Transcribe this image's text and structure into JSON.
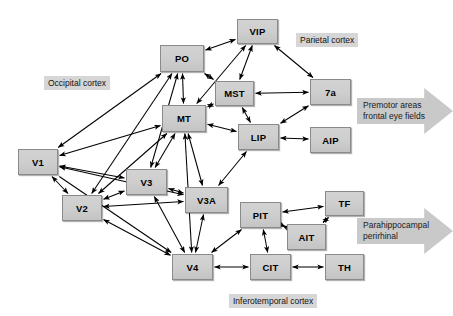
{
  "figure": {
    "background": "#ffffff",
    "node_fill": "#cfcfcf",
    "node_border": "#8a8a8a",
    "label_fill": "#d6d6d6",
    "arrow_fill": "#c9c9c9",
    "edge_color": "#000000"
  },
  "nodes": [
    {
      "id": "V1",
      "label": "V1",
      "x": 18,
      "y": 149,
      "w": 40,
      "h": 26
    },
    {
      "id": "V2",
      "label": "V2",
      "x": 62,
      "y": 195,
      "w": 40,
      "h": 26
    },
    {
      "id": "V3",
      "label": "V3",
      "x": 126,
      "y": 169,
      "w": 41,
      "h": 26
    },
    {
      "id": "V3A",
      "label": "V3A",
      "x": 185,
      "y": 187,
      "w": 43,
      "h": 26
    },
    {
      "id": "V4",
      "label": "V4",
      "x": 172,
      "y": 254,
      "w": 41,
      "h": 26
    },
    {
      "id": "PO",
      "label": "PO",
      "x": 160,
      "y": 45,
      "w": 44,
      "h": 27
    },
    {
      "id": "MT",
      "label": "MT",
      "x": 162,
      "y": 105,
      "w": 44,
      "h": 27
    },
    {
      "id": "VIP",
      "label": "VIP",
      "x": 237,
      "y": 19,
      "w": 41,
      "h": 25
    },
    {
      "id": "MST",
      "label": "MST",
      "x": 215,
      "y": 81,
      "w": 39,
      "h": 25
    },
    {
      "id": "LIP",
      "label": "LIP",
      "x": 238,
      "y": 124,
      "w": 41,
      "h": 26
    },
    {
      "id": "7a",
      "label": "7a",
      "x": 310,
      "y": 79,
      "w": 41,
      "h": 26
    },
    {
      "id": "AIP",
      "label": "AIP",
      "x": 310,
      "y": 127,
      "w": 41,
      "h": 26
    },
    {
      "id": "PIT",
      "label": "PIT",
      "x": 240,
      "y": 202,
      "w": 41,
      "h": 26
    },
    {
      "id": "AIT",
      "label": "AIT",
      "x": 287,
      "y": 224,
      "w": 39,
      "h": 26
    },
    {
      "id": "TF",
      "label": "TF",
      "x": 325,
      "y": 191,
      "w": 39,
      "h": 25
    },
    {
      "id": "CIT",
      "label": "CIT",
      "x": 250,
      "y": 254,
      "w": 41,
      "h": 26
    },
    {
      "id": "TH",
      "label": "TH",
      "x": 325,
      "y": 254,
      "w": 39,
      "h": 26
    }
  ],
  "region_labels": [
    {
      "id": "occipital",
      "text": "Occipital cortex",
      "x": 44,
      "y": 76
    },
    {
      "id": "parietal",
      "text": "Parietal cortex",
      "x": 296,
      "y": 33
    },
    {
      "id": "inferotemporal",
      "text": "Inferotemporal cortex",
      "x": 229,
      "y": 294
    }
  ],
  "flow_arrows": [
    {
      "id": "premotor",
      "line1": "Premotor areas",
      "line2": "frontal eye fields",
      "x": 357,
      "y": 88,
      "w": 96,
      "h": 46
    },
    {
      "id": "parahippocampal",
      "line1": "Parahippocampal",
      "line2": "perirhinal",
      "x": 357,
      "y": 208,
      "w": 96,
      "h": 46
    }
  ],
  "edges": [
    {
      "from": "V1",
      "to": "PO",
      "heads": "both"
    },
    {
      "from": "V1",
      "to": "MT",
      "heads": "both"
    },
    {
      "from": "V1",
      "to": "V2",
      "heads": "both"
    },
    {
      "from": "V1",
      "to": "V3",
      "heads": "both"
    },
    {
      "from": "V1",
      "to": "V3A",
      "heads": "both"
    },
    {
      "from": "V1",
      "to": "V4",
      "heads": "end"
    },
    {
      "from": "V2",
      "to": "V3",
      "heads": "both"
    },
    {
      "from": "V2",
      "to": "V3A",
      "heads": "both"
    },
    {
      "from": "V2",
      "to": "V4",
      "heads": "both"
    },
    {
      "from": "V2",
      "to": "MT",
      "heads": "both"
    },
    {
      "from": "V2",
      "to": "PO",
      "heads": "both"
    },
    {
      "from": "V3",
      "to": "V3A",
      "heads": "both"
    },
    {
      "from": "V3",
      "to": "V4",
      "heads": "both"
    },
    {
      "from": "V3",
      "to": "MT",
      "heads": "both"
    },
    {
      "from": "V3",
      "to": "PO",
      "heads": "both"
    },
    {
      "from": "V3A",
      "to": "MT",
      "heads": "both"
    },
    {
      "from": "V3A",
      "to": "V4",
      "heads": "both"
    },
    {
      "from": "V3A",
      "to": "LIP",
      "heads": "both"
    },
    {
      "from": "V4",
      "to": "MT",
      "heads": "both"
    },
    {
      "from": "V4",
      "to": "PIT",
      "heads": "both"
    },
    {
      "from": "V4",
      "to": "CIT",
      "heads": "both"
    },
    {
      "from": "PO",
      "to": "MT",
      "heads": "both"
    },
    {
      "from": "PO",
      "to": "VIP",
      "heads": "both"
    },
    {
      "from": "PO",
      "to": "MST",
      "heads": "both"
    },
    {
      "from": "MT",
      "to": "MST",
      "heads": "both"
    },
    {
      "from": "MT",
      "to": "VIP",
      "heads": "both"
    },
    {
      "from": "MT",
      "to": "LIP",
      "heads": "both"
    },
    {
      "from": "MST",
      "to": "VIP",
      "heads": "both"
    },
    {
      "from": "MST",
      "to": "7a",
      "heads": "both"
    },
    {
      "from": "MST",
      "to": "LIP",
      "heads": "both"
    },
    {
      "from": "VIP",
      "to": "7a",
      "heads": "both"
    },
    {
      "from": "LIP",
      "to": "7a",
      "heads": "both"
    },
    {
      "from": "LIP",
      "to": "AIP",
      "heads": "both"
    },
    {
      "from": "PIT",
      "to": "AIT",
      "heads": "both"
    },
    {
      "from": "PIT",
      "to": "TF",
      "heads": "both"
    },
    {
      "from": "PIT",
      "to": "CIT",
      "heads": "both"
    },
    {
      "from": "AIT",
      "to": "TF",
      "heads": "both"
    },
    {
      "from": "CIT",
      "to": "TH",
      "heads": "both"
    }
  ]
}
